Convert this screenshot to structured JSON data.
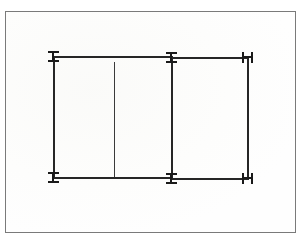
{
  "figure": {
    "description": "Scanned engineering line drawing: two adjoining rectangular bays outlined with heavy lines, with I-shaped and H-shaped dimension terminal marks at each corner and an interior vertical partition line in the left bay.",
    "background_color": "#ffffff",
    "line_color": "#262626",
    "terminal_color": "#1a1a1a",
    "frame_color": "#7a7a7a"
  },
  "frame": {
    "name": "page-border",
    "x": 5,
    "y": 11,
    "width": 291,
    "height": 222,
    "stroke_width": 1
  },
  "horizontal_lines": [
    {
      "id": "top-left-span",
      "x": 53,
      "y": 56,
      "length": 120,
      "thickness": 2
    },
    {
      "id": "top-right-span",
      "x": 171,
      "y": 57,
      "length": 78,
      "thickness": 2
    },
    {
      "id": "bottom-left-span",
      "x": 53,
      "y": 177,
      "length": 120,
      "thickness": 2
    },
    {
      "id": "bottom-right-span",
      "x": 171,
      "y": 178,
      "length": 78,
      "thickness": 2
    }
  ],
  "vertical_lines": [
    {
      "id": "left-edge",
      "x": 53,
      "y": 56,
      "length": 123,
      "thickness": 2
    },
    {
      "id": "middle-edge",
      "x": 171,
      "y": 57,
      "length": 122,
      "thickness": 2
    },
    {
      "id": "right-edge",
      "x": 247,
      "y": 57,
      "length": 122,
      "thickness": 2
    },
    {
      "id": "interior-partition",
      "x": 114,
      "y": 62,
      "length": 115,
      "thickness": 1
    }
  ],
  "terminals": [
    {
      "id": "terminal-top-left",
      "glyph": "I",
      "x": 48,
      "y": 51
    },
    {
      "id": "terminal-top-middle",
      "glyph": "I",
      "x": 166,
      "y": 52
    },
    {
      "id": "terminal-top-right",
      "glyph": "H",
      "x": 242,
      "y": 52
    },
    {
      "id": "terminal-bottom-left",
      "glyph": "I",
      "x": 48,
      "y": 172
    },
    {
      "id": "terminal-bottom-middle",
      "glyph": "I",
      "x": 166,
      "y": 173
    },
    {
      "id": "terminal-bottom-right",
      "glyph": "H",
      "x": 242,
      "y": 173
    }
  ],
  "labels": {
    "none_visible": ""
  }
}
